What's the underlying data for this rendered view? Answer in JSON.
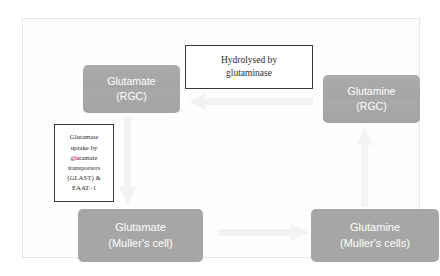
{
  "diagram": {
    "colors": {
      "entity_box_fill": "#a6a6a6",
      "entity_box_text": "#ffffff",
      "note_border": "#3a3a3a",
      "note_text": "#2b2b2b",
      "arrow_fill": "#e9e9e9",
      "frame_border": "#e6e6e6",
      "background": "#ffffff"
    },
    "entities": [
      {
        "id": "glutamate-rgc",
        "line1": "Glutamate",
        "line2": "(RGC)",
        "position": "top-left"
      },
      {
        "id": "glutamine-rgc",
        "line1": "Glutamine",
        "line2": "(RGC)",
        "position": "top-right"
      },
      {
        "id": "glutamate-muller",
        "line1": "Glutamate",
        "line2": "(Muller's cell)",
        "position": "bottom-left"
      },
      {
        "id": "glutamine-muller",
        "line1": "Glutamine",
        "line2": "(Muller's cells)",
        "position": "bottom-right"
      }
    ],
    "notes": {
      "hydrolysed": {
        "line1": "Hydrolysed by",
        "line2": "glutaminase"
      },
      "uptake": {
        "line1": "Glutamate",
        "line2": "uptake by",
        "line3": "glutamate",
        "line4": "transporters",
        "line5": "(GLAST) &",
        "line6": "EAAT–1"
      }
    },
    "arrows": [
      {
        "id": "arrow-top-left",
        "direction": "left",
        "from": "glutamine-rgc",
        "to": "glutamate-rgc"
      },
      {
        "id": "arrow-left-down",
        "direction": "down",
        "from": "glutamate-rgc",
        "to": "glutamate-muller"
      },
      {
        "id": "arrow-right-up",
        "direction": "up",
        "from": "glutamine-muller",
        "to": "glutamine-rgc"
      },
      {
        "id": "arrow-bottom-right",
        "direction": "right",
        "from": "glutamate-muller",
        "to": "glutamine-muller"
      }
    ]
  }
}
